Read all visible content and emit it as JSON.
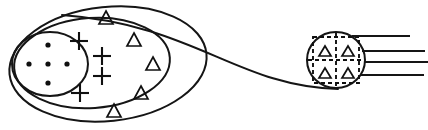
{
  "figure": {
    "title": "Nested set diagram with mapping to partitioned target region",
    "background_color": "#ffffff",
    "stroke_color": "#151515",
    "canvas": {
      "width": 428,
      "height": 130
    }
  },
  "source_region": {
    "name": "source-ellipse-group",
    "ellipses": [
      {
        "label": "outer-ellipse",
        "cx": 108,
        "cy": 64,
        "rx": 99,
        "ry": 57,
        "rotation": -6,
        "stroke_width": 2.0,
        "contains": "triangles"
      },
      {
        "label": "middle-ellipse",
        "cx": 92,
        "cy": 63,
        "rx": 78,
        "ry": 45,
        "rotation": -4,
        "stroke_width": 2.0,
        "contains": "plus-signs"
      },
      {
        "label": "inner-circle",
        "cx": 50,
        "cy": 64,
        "rx": 38,
        "ry": 32,
        "rotation": 0,
        "stroke_width": 2.0,
        "contains": "dots"
      }
    ],
    "dots": {
      "name": "dot-markers",
      "count": 5,
      "radius": 2.6,
      "points": [
        {
          "x": 48,
          "y": 45
        },
        {
          "x": 29,
          "y": 64
        },
        {
          "x": 48,
          "y": 64
        },
        {
          "x": 67,
          "y": 64
        },
        {
          "x": 48,
          "y": 83
        }
      ]
    },
    "plus_signs": {
      "name": "plus-markers",
      "count": 4,
      "size": 9,
      "points": [
        {
          "x": 79,
          "y": 41
        },
        {
          "x": 102,
          "y": 56
        },
        {
          "x": 102,
          "y": 76
        },
        {
          "x": 80,
          "y": 93
        }
      ]
    },
    "triangles": {
      "name": "triangle-markers",
      "count": 5,
      "size": 10,
      "points": [
        {
          "x": 106,
          "y": 18
        },
        {
          "x": 134,
          "y": 40
        },
        {
          "x": 153,
          "y": 64
        },
        {
          "x": 141,
          "y": 93
        },
        {
          "x": 114,
          "y": 111
        }
      ]
    }
  },
  "connector": {
    "name": "mapping-curve",
    "stroke_width": 2.0,
    "from": {
      "x": 62,
      "y": 15
    },
    "to": {
      "x": 338,
      "y": 89
    },
    "control_1": {
      "x": 196,
      "y": 25
    },
    "control_2": {
      "x": 236,
      "y": 86
    }
  },
  "target_region": {
    "name": "target-ellipse",
    "ellipse": {
      "cx": 336,
      "cy": 60,
      "rx": 29,
      "ry": 28,
      "stroke_width": 2.0
    },
    "grid": {
      "name": "dashed-partition-grid",
      "vertical_x": 336,
      "horizontal_y": 60,
      "cells": 4,
      "box": {
        "x": 313,
        "y": 37,
        "w": 46,
        "h": 46
      }
    },
    "triangles": {
      "name": "target-triangle-markers",
      "count": 4,
      "size": 8,
      "points": [
        {
          "x": 325,
          "y": 51
        },
        {
          "x": 348,
          "y": 51
        },
        {
          "x": 325,
          "y": 73
        },
        {
          "x": 348,
          "y": 73
        }
      ]
    }
  },
  "output_lines": {
    "name": "output-line-bundle",
    "count": 4,
    "stroke_width": 2.1,
    "lines": [
      {
        "label": "line-1",
        "x1": 352,
        "y1": 36,
        "x2": 410,
        "y2": 36
      },
      {
        "label": "line-2",
        "x1": 362,
        "y1": 51,
        "x2": 425,
        "y2": 51
      },
      {
        "label": "line-3",
        "x1": 365,
        "y1": 62,
        "x2": 428,
        "y2": 62
      },
      {
        "label": "line-4",
        "x1": 360,
        "y1": 75,
        "x2": 424,
        "y2": 75
      }
    ]
  }
}
